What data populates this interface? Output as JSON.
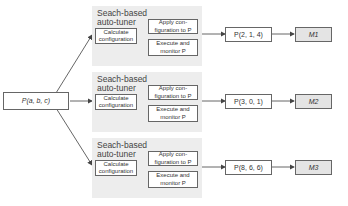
{
  "input": {
    "label": "P(a, b, c)"
  },
  "tuners": [
    {
      "title_line1": "Seach-based",
      "title_line2": "auto-tuner",
      "calculate": [
        "Calculate",
        "configuration"
      ],
      "apply": [
        "Apply con-",
        "figuration to P"
      ],
      "execute": [
        "Execute and",
        "monitor P"
      ],
      "result": "P(2, 1, 4)",
      "model": "M1"
    },
    {
      "title_line1": "Seach-based",
      "title_line2": "auto-tuner",
      "calculate": [
        "Calculate",
        "configuration"
      ],
      "apply": [
        "Apply con-",
        "figuration to P"
      ],
      "execute": [
        "Execute and",
        "monitor P"
      ],
      "result": "P(3, 0, 1)",
      "model": "M2"
    },
    {
      "title_line1": "Seach-based",
      "title_line2": "auto-tuner",
      "calculate": [
        "Calculate",
        "configuration"
      ],
      "apply": [
        "Apply con-",
        "figuration to P"
      ],
      "execute": [
        "Execute and",
        "monitor P"
      ],
      "result": "P(8, 6, 6)",
      "model": "M3"
    }
  ],
  "colors": {
    "panel": "#ededed",
    "model_box": "#e4e4e4",
    "stroke": "#555555"
  }
}
